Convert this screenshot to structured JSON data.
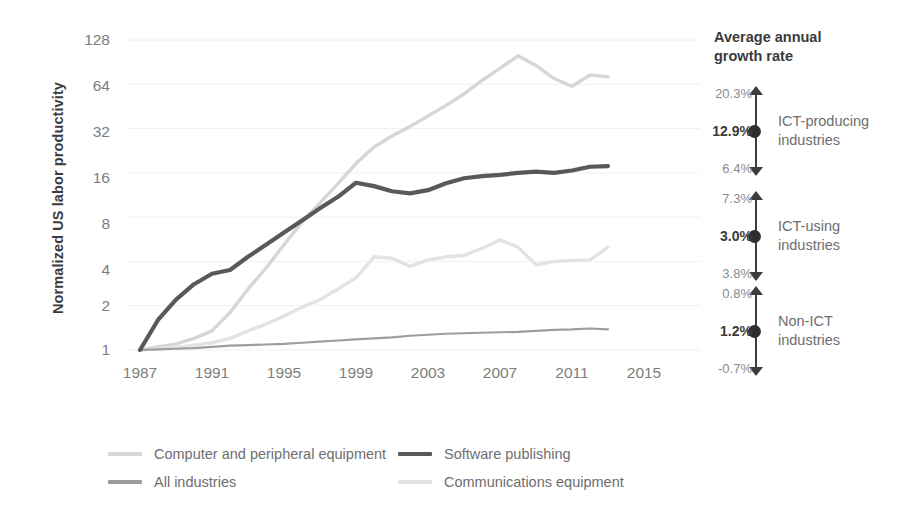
{
  "axes": {
    "ylabel": "Normalized US labor productivity",
    "yticks": [
      "1",
      "2",
      "4",
      "8",
      "16",
      "32",
      "64",
      "128"
    ],
    "xticks": [
      "1987",
      "1991",
      "1995",
      "1999",
      "2003",
      "2007",
      "2011",
      "2015"
    ]
  },
  "legend": [
    {
      "label": "Computer and peripheral equipment",
      "color": "#d5d6d7"
    },
    {
      "label": "Software publishing",
      "color": "#59595b"
    },
    {
      "label": "All industries",
      "color": "#9c9d9f"
    },
    {
      "label": "Communications equipment",
      "color": "#e2e3e4"
    }
  ],
  "annotations": {
    "title": "Average annual\ngrowth rate",
    "title_line1": "Average annual",
    "title_line2": "growth rate",
    "groups": [
      {
        "high": "20.3%",
        "mid": "12.9%",
        "low": "6.4%",
        "name": "ICT-producing\nindustries",
        "name_line1": "ICT-producing",
        "name_line2": "industries"
      },
      {
        "high": "7.3%",
        "mid": "3.0%",
        "low": "3.8%",
        "name": "ICT-using\nindustries",
        "name_line1": "ICT-using",
        "name_line2": "industries"
      },
      {
        "high": "0.8%",
        "mid": "1.2%",
        "low": "-0.7%",
        "name": "Non-ICT\nindustries",
        "name_line1": "Non-ICT",
        "name_line2": "industries"
      }
    ]
  },
  "chart_data": {
    "type": "line",
    "title": "",
    "xlabel": "",
    "ylabel": "Normalized US labor productivity",
    "yscale": "log2",
    "ylim": [
      1,
      128
    ],
    "xlim": [
      1987,
      2015
    ],
    "grid": true,
    "legend_position": "bottom",
    "x": [
      1987,
      1988,
      1989,
      1990,
      1991,
      1992,
      1993,
      1994,
      1995,
      1996,
      1997,
      1998,
      1999,
      2000,
      2001,
      2002,
      2003,
      2004,
      2005,
      2006,
      2007,
      2008,
      2009,
      2010,
      2011,
      2012,
      2013
    ],
    "series": [
      {
        "name": "Computer and peripheral equipment",
        "color": "#d5d6d7",
        "values": [
          1.0,
          1.05,
          1.1,
          1.2,
          1.35,
          1.8,
          2.6,
          3.6,
          5.2,
          7.4,
          10.0,
          13.5,
          18.5,
          24.0,
          28.5,
          33.0,
          39.0,
          46.0,
          55.0,
          68.0,
          82.0,
          100.0,
          86.0,
          70.0,
          62.0,
          74.0,
          72.0
        ]
      },
      {
        "name": "Software publishing",
        "color": "#59595b",
        "values": [
          1.0,
          1.6,
          2.2,
          2.8,
          3.3,
          3.5,
          4.3,
          5.2,
          6.3,
          7.6,
          9.2,
          11.0,
          13.7,
          13.0,
          12.0,
          11.6,
          12.2,
          13.6,
          14.7,
          15.2,
          15.5,
          16.0,
          16.3,
          16.0,
          16.6,
          17.6,
          17.8
        ]
      },
      {
        "name": "Communications equipment",
        "color": "#e2e3e4"
      },
      {
        "name": "All industries",
        "color": "#9c9d9f",
        "values": [
          1.0,
          1.01,
          1.02,
          1.03,
          1.05,
          1.07,
          1.08,
          1.09,
          1.1,
          1.12,
          1.14,
          1.16,
          1.18,
          1.2,
          1.22,
          1.25,
          1.27,
          1.29,
          1.3,
          1.31,
          1.32,
          1.33,
          1.35,
          1.37,
          1.38,
          1.4,
          1.38
        ]
      }
    ],
    "series_communications_values": [
      1.0,
      1.02,
      1.04,
      1.08,
      1.12,
      1.2,
      1.35,
      1.5,
      1.7,
      1.95,
      2.2,
      2.6,
      3.1,
      4.3,
      4.2,
      3.7,
      4.1,
      4.3,
      4.4,
      4.9,
      5.6,
      5.0,
      3.8,
      4.0,
      4.05,
      4.1,
      5.0
    ]
  }
}
